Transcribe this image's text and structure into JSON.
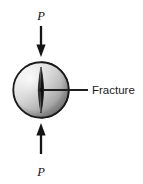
{
  "figure": {
    "background_color": "#ffffff",
    "width": 143,
    "height": 184
  },
  "labels": {
    "load_top": "P",
    "load_bottom": "P",
    "fracture": "Fracture"
  },
  "icons": {
    "arrow_down": "arrow-down-icon",
    "arrow_up": "arrow-up-icon",
    "disc": "disc-specimen-icon",
    "crack": "fracture-crack-icon",
    "leader": "leader-line-icon"
  },
  "colors": {
    "outline": "#1a1a1a",
    "arrow": "#141414",
    "crack": "#111111",
    "leader": "#1f1f1f",
    "disc_light": "#f2f2f2",
    "disc_mid": "#c9c9c9",
    "disc_dark": "#8f8f8f",
    "disc_edge": "#6e6e6e"
  },
  "geometry": {
    "disc_center_x": 41,
    "disc_center_y": 90,
    "disc_radius": 28,
    "disc_thickness_offset": 6,
    "crack_height": 44,
    "crack_width": 5,
    "arrow_top_start_y": 26,
    "arrow_top_end_y": 57,
    "arrow_bottom_start_y": 154,
    "arrow_bottom_end_y": 123,
    "leader_start_x": 41,
    "leader_end_x": 88,
    "leader_y": 90
  }
}
